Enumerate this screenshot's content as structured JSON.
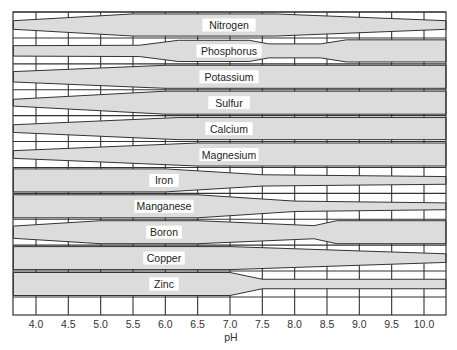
{
  "chart_data": {
    "type": "area",
    "title": "",
    "xlabel": "pH",
    "ylabel": "",
    "x_ticks": [
      "4.0",
      "4.5",
      "5.0",
      "5.5",
      "6.0",
      "6.5",
      "7.0",
      "7.5",
      "8.0",
      "8.5",
      "9.0",
      "9.5",
      "10.0"
    ],
    "xlim": [
      3.65,
      10.35
    ],
    "grid": true,
    "legend": "none",
    "series": [
      {
        "name": "Nitrogen",
        "points": [
          [
            3.65,
            0.2
          ],
          [
            5.5,
            0.95
          ],
          [
            7.7,
            0.95
          ],
          [
            10.35,
            0.2
          ]
        ]
      },
      {
        "name": "Phosphorus",
        "points": [
          [
            3.65,
            0.3
          ],
          [
            5.6,
            0.35
          ],
          [
            6.2,
            0.9
          ],
          [
            7.3,
            0.9
          ],
          [
            7.6,
            0.5
          ],
          [
            8.4,
            0.5
          ],
          [
            8.8,
            0.95
          ],
          [
            10.35,
            0.95
          ]
        ]
      },
      {
        "name": "Potassium",
        "points": [
          [
            3.65,
            0.3
          ],
          [
            6.0,
            1.0
          ],
          [
            10.35,
            1.0
          ]
        ]
      },
      {
        "name": "Sulfur",
        "points": [
          [
            3.65,
            0.1
          ],
          [
            6.0,
            1.0
          ],
          [
            10.35,
            1.0
          ]
        ]
      },
      {
        "name": "Calcium",
        "points": [
          [
            3.65,
            0.15
          ],
          [
            6.2,
            0.95
          ],
          [
            10.35,
            0.95
          ]
        ]
      },
      {
        "name": "Magnesium",
        "points": [
          [
            3.65,
            0.15
          ],
          [
            6.5,
            1.0
          ],
          [
            10.35,
            1.0
          ]
        ]
      },
      {
        "name": "Iron",
        "points": [
          [
            3.65,
            1.0
          ],
          [
            6.0,
            1.0
          ],
          [
            7.5,
            0.35
          ],
          [
            10.35,
            0.15
          ]
        ]
      },
      {
        "name": "Manganese",
        "points": [
          [
            3.65,
            1.0
          ],
          [
            6.5,
            1.0
          ],
          [
            8.0,
            0.3
          ],
          [
            10.35,
            0.1
          ]
        ]
      },
      {
        "name": "Boron",
        "points": [
          [
            3.65,
            0.4
          ],
          [
            5.0,
            1.0
          ],
          [
            6.5,
            1.0
          ],
          [
            8.3,
            0.45
          ],
          [
            8.65,
            1.0
          ],
          [
            10.35,
            1.0
          ]
        ]
      },
      {
        "name": "Copper",
        "points": [
          [
            3.65,
            1.0
          ],
          [
            7.0,
            1.0
          ],
          [
            10.35,
            0.2
          ]
        ]
      },
      {
        "name": "Zinc",
        "points": [
          [
            3.65,
            1.0
          ],
          [
            7.0,
            1.0
          ],
          [
            7.5,
            0.25
          ],
          [
            10.35,
            0.25
          ]
        ]
      }
    ]
  },
  "labels": {
    "nitrogen": "Nitrogen",
    "phosphorus": "Phosphorus",
    "potassium": "Potassium",
    "sulfur": "Sulfur",
    "calcium": "Calcium",
    "magnesium": "Magnesium",
    "iron": "Iron",
    "manganese": "Manganese",
    "boron": "Boron",
    "copper": "Copper",
    "zinc": "Zinc"
  },
  "axis": {
    "title": "pH",
    "ticks": [
      "4.0",
      "4.5",
      "5.0",
      "5.5",
      "6.0",
      "6.5",
      "7.0",
      "7.5",
      "8.0",
      "8.5",
      "9.0",
      "9.5",
      "10.0"
    ]
  }
}
